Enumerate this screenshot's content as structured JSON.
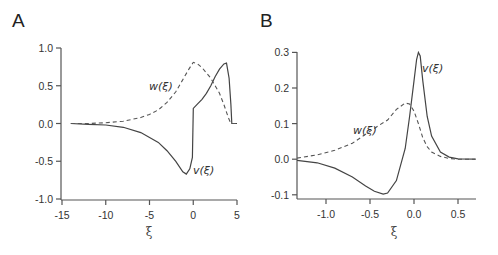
{
  "panels": {
    "A": {
      "letter": "A"
    },
    "B": {
      "letter": "B"
    }
  },
  "chart_data": [
    {
      "type": "line",
      "panel": "A",
      "title": "",
      "xlabel": "ξ",
      "ylabel": "",
      "xlim": [
        -14.2,
        5.3
      ],
      "ylim": [
        -1.0,
        1.0
      ],
      "xticks": [
        -15,
        -10,
        -5,
        0,
        5
      ],
      "xtick_labels": [
        "-15",
        "-10",
        "-5",
        "0",
        "5"
      ],
      "yticks": [
        1.0,
        0.5,
        0.0,
        -0.5,
        -1.0
      ],
      "ytick_labels": [
        "1.0",
        "0.5",
        "0.0",
        "-0.5",
        "-1.0"
      ],
      "grid": false,
      "legend": "inline labels",
      "series": [
        {
          "name": "v(ξ)",
          "style": "solid",
          "label": "v(ξ)",
          "x": [
            -14,
            -12,
            -10,
            -8,
            -6,
            -4,
            -3,
            -2,
            -1.2,
            -0.8,
            -0.4,
            -0.1,
            0.0,
            0.5,
            1.0,
            1.5,
            2.0,
            2.5,
            3.0,
            3.5,
            3.8,
            4.1,
            4.3,
            4.4,
            5.0
          ],
          "y": [
            0.0,
            -0.01,
            -0.02,
            -0.05,
            -0.12,
            -0.25,
            -0.36,
            -0.5,
            -0.64,
            -0.67,
            -0.6,
            -0.45,
            0.2,
            0.26,
            0.32,
            0.4,
            0.5,
            0.62,
            0.72,
            0.79,
            0.8,
            0.6,
            0.25,
            0.0,
            0.0
          ]
        },
        {
          "name": "w(ξ)",
          "style": "dashed",
          "label": "w(ξ)",
          "x": [
            -14,
            -12,
            -10,
            -8,
            -6,
            -5,
            -4,
            -3,
            -2,
            -1,
            -0.5,
            0.0,
            0.5,
            1.0,
            2.0,
            3.0,
            3.5,
            4.0,
            4.3,
            5.0
          ],
          "y": [
            0.0,
            0.0,
            0.01,
            0.03,
            0.08,
            0.12,
            0.18,
            0.28,
            0.42,
            0.62,
            0.72,
            0.81,
            0.79,
            0.74,
            0.6,
            0.4,
            0.25,
            0.08,
            0.0,
            0.0
          ]
        }
      ]
    },
    {
      "type": "line",
      "panel": "B",
      "title": "",
      "xlabel": "ξ",
      "ylabel": "",
      "xlim": [
        -1.33,
        0.7
      ],
      "ylim": [
        -0.11,
        0.31
      ],
      "xticks": [
        -1.0,
        -0.5,
        0.0,
        0.5
      ],
      "xtick_labels": [
        "-1.0",
        "-0.5",
        "0.0",
        "0.5"
      ],
      "yticks": [
        0.3,
        0.2,
        0.1,
        0.0,
        -0.1
      ],
      "ytick_labels": [
        "0.3",
        "0.2",
        "0.1",
        "0.0",
        "-0.1"
      ],
      "grid": false,
      "legend": "inline labels",
      "series": [
        {
          "name": "v(ξ)",
          "style": "solid",
          "label": "v(ξ)",
          "x": [
            -1.33,
            -1.1,
            -0.9,
            -0.7,
            -0.55,
            -0.45,
            -0.35,
            -0.3,
            -0.2,
            -0.1,
            -0.05,
            0.0,
            0.03,
            0.05,
            0.07,
            0.1,
            0.15,
            0.2,
            0.3,
            0.4,
            0.5,
            0.7
          ],
          "y": [
            -0.003,
            -0.01,
            -0.025,
            -0.05,
            -0.075,
            -0.09,
            -0.098,
            -0.095,
            -0.06,
            0.03,
            0.12,
            0.22,
            0.28,
            0.3,
            0.29,
            0.22,
            0.12,
            0.065,
            0.02,
            0.006,
            0.001,
            0.0
          ]
        },
        {
          "name": "w(ξ)",
          "style": "dashed",
          "label": "w(ξ)",
          "x": [
            -1.33,
            -1.1,
            -0.9,
            -0.7,
            -0.55,
            -0.4,
            -0.3,
            -0.2,
            -0.1,
            -0.05,
            0.0,
            0.05,
            0.1,
            0.15,
            0.2,
            0.3,
            0.4,
            0.5,
            0.7
          ],
          "y": [
            0.003,
            0.012,
            0.025,
            0.045,
            0.07,
            0.095,
            0.11,
            0.14,
            0.158,
            0.155,
            0.135,
            0.1,
            0.06,
            0.035,
            0.02,
            0.008,
            0.002,
            0.0,
            0.0
          ]
        }
      ]
    }
  ]
}
